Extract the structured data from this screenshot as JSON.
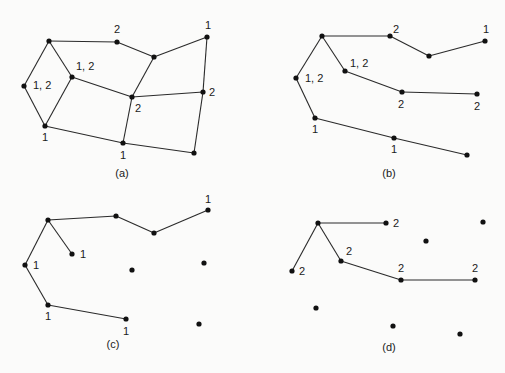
{
  "figure": {
    "panels": [
      {
        "id": "a",
        "caption": "(a)",
        "caption_pos": [
          122,
          177
        ],
        "nodes": [
          {
            "id": "A",
            "x": 49,
            "y": 41
          },
          {
            "id": "B",
            "x": 117,
            "y": 42
          },
          {
            "id": "C",
            "x": 154,
            "y": 57
          },
          {
            "id": "D",
            "x": 207,
            "y": 37
          },
          {
            "id": "E",
            "x": 24,
            "y": 86
          },
          {
            "id": "F",
            "x": 72,
            "y": 77
          },
          {
            "id": "G",
            "x": 132,
            "y": 97
          },
          {
            "id": "H",
            "x": 203,
            "y": 92
          },
          {
            "id": "I",
            "x": 45,
            "y": 126
          },
          {
            "id": "J",
            "x": 123,
            "y": 143
          },
          {
            "id": "K",
            "x": 194,
            "y": 153
          }
        ],
        "edges": [
          [
            "A",
            "B"
          ],
          [
            "B",
            "C"
          ],
          [
            "C",
            "D"
          ],
          [
            "A",
            "E"
          ],
          [
            "A",
            "F"
          ],
          [
            "E",
            "I"
          ],
          [
            "F",
            "I"
          ],
          [
            "F",
            "G"
          ],
          [
            "C",
            "G"
          ],
          [
            "G",
            "H"
          ],
          [
            "D",
            "H"
          ],
          [
            "H",
            "K"
          ],
          [
            "G",
            "J"
          ],
          [
            "I",
            "J"
          ],
          [
            "J",
            "K"
          ]
        ],
        "labels": [
          {
            "text": "2",
            "x": 114,
            "y": 33
          },
          {
            "text": "1",
            "x": 205,
            "y": 29
          },
          {
            "text": "1, 2",
            "x": 33,
            "y": 89
          },
          {
            "text": "1, 2",
            "x": 76,
            "y": 70
          },
          {
            "text": "2",
            "x": 135,
            "y": 112
          },
          {
            "text": "2",
            "x": 209,
            "y": 96
          },
          {
            "text": "1",
            "x": 42,
            "y": 141
          },
          {
            "text": "1",
            "x": 120,
            "y": 159
          }
        ]
      },
      {
        "id": "b",
        "caption": "(b)",
        "caption_pos": [
          389,
          177
        ],
        "nodes": [
          {
            "id": "A",
            "x": 322,
            "y": 36
          },
          {
            "id": "B",
            "x": 390,
            "y": 36
          },
          {
            "id": "C",
            "x": 429,
            "y": 56
          },
          {
            "id": "D",
            "x": 485,
            "y": 41
          },
          {
            "id": "E",
            "x": 296,
            "y": 78
          },
          {
            "id": "F",
            "x": 345,
            "y": 71
          },
          {
            "id": "G",
            "x": 402,
            "y": 92
          },
          {
            "id": "H",
            "x": 477,
            "y": 94
          },
          {
            "id": "I",
            "x": 315,
            "y": 118
          },
          {
            "id": "J",
            "x": 394,
            "y": 138
          },
          {
            "id": "K",
            "x": 467,
            "y": 155
          }
        ],
        "edges": [
          [
            "A",
            "B"
          ],
          [
            "B",
            "C"
          ],
          [
            "C",
            "D"
          ],
          [
            "A",
            "E"
          ],
          [
            "A",
            "F"
          ],
          [
            "E",
            "I"
          ],
          [
            "F",
            "G"
          ],
          [
            "G",
            "H"
          ],
          [
            "I",
            "J"
          ],
          [
            "J",
            "K"
          ]
        ],
        "labels": [
          {
            "text": "2",
            "x": 393,
            "y": 33
          },
          {
            "text": "1",
            "x": 483,
            "y": 33
          },
          {
            "text": "1, 2",
            "x": 305,
            "y": 82
          },
          {
            "text": "1, 2",
            "x": 350,
            "y": 67
          },
          {
            "text": "2",
            "x": 398,
            "y": 108
          },
          {
            "text": "2",
            "x": 474,
            "y": 110
          },
          {
            "text": "1",
            "x": 312,
            "y": 133
          },
          {
            "text": "1",
            "x": 391,
            "y": 153
          }
        ]
      },
      {
        "id": "c",
        "caption": "(c)",
        "caption_pos": [
          113,
          348
        ],
        "nodes": [
          {
            "id": "A",
            "x": 48,
            "y": 220
          },
          {
            "id": "B",
            "x": 116,
            "y": 216
          },
          {
            "id": "C",
            "x": 154,
            "y": 233
          },
          {
            "id": "D",
            "x": 208,
            "y": 210
          },
          {
            "id": "E",
            "x": 25,
            "y": 265
          },
          {
            "id": "F",
            "x": 72,
            "y": 254
          },
          {
            "id": "G",
            "x": 132,
            "y": 270
          },
          {
            "id": "H",
            "x": 204,
            "y": 263
          },
          {
            "id": "I",
            "x": 48,
            "y": 305
          },
          {
            "id": "J",
            "x": 126,
            "y": 319
          },
          {
            "id": "K",
            "x": 199,
            "y": 324
          }
        ],
        "edges": [
          [
            "A",
            "B"
          ],
          [
            "B",
            "C"
          ],
          [
            "C",
            "D"
          ],
          [
            "A",
            "E"
          ],
          [
            "A",
            "F"
          ],
          [
            "E",
            "I"
          ],
          [
            "I",
            "J"
          ]
        ],
        "labels": [
          {
            "text": "1",
            "x": 205,
            "y": 203
          },
          {
            "text": "1",
            "x": 80,
            "y": 258
          },
          {
            "text": "1",
            "x": 33,
            "y": 269
          },
          {
            "text": "1",
            "x": 45,
            "y": 320
          },
          {
            "text": "1",
            "x": 123,
            "y": 335
          }
        ]
      },
      {
        "id": "d",
        "caption": "(d)",
        "caption_pos": [
          389,
          351
        ],
        "nodes": [
          {
            "id": "A",
            "x": 318,
            "y": 223
          },
          {
            "id": "B",
            "x": 386,
            "y": 223
          },
          {
            "id": "C",
            "x": 426,
            "y": 241
          },
          {
            "id": "D",
            "x": 483,
            "y": 222
          },
          {
            "id": "E",
            "x": 292,
            "y": 271
          },
          {
            "id": "F",
            "x": 341,
            "y": 261
          },
          {
            "id": "G",
            "x": 401,
            "y": 280
          },
          {
            "id": "H",
            "x": 475,
            "y": 280
          },
          {
            "id": "I",
            "x": 316,
            "y": 308
          },
          {
            "id": "J",
            "x": 393,
            "y": 326
          },
          {
            "id": "K",
            "x": 460,
            "y": 334
          }
        ],
        "edges": [
          [
            "A",
            "B"
          ],
          [
            "A",
            "E"
          ],
          [
            "A",
            "F"
          ],
          [
            "F",
            "G"
          ],
          [
            "G",
            "H"
          ]
        ],
        "labels": [
          {
            "text": "2",
            "x": 393,
            "y": 227
          },
          {
            "text": "2",
            "x": 346,
            "y": 255
          },
          {
            "text": "2",
            "x": 299,
            "y": 275
          },
          {
            "text": "2",
            "x": 398,
            "y": 272
          },
          {
            "text": "2",
            "x": 472,
            "y": 272
          }
        ]
      }
    ]
  }
}
